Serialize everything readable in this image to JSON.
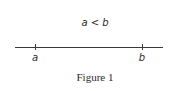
{
  "figure": {
    "relation_text": "a < b",
    "caption": "Figure 1"
  },
  "number_line": {
    "points": [
      {
        "label": "a"
      },
      {
        "label": "b"
      }
    ]
  },
  "colors": {
    "line": "#3a3a3a",
    "text": "#2a2a2a",
    "background": "#ffffff"
  }
}
